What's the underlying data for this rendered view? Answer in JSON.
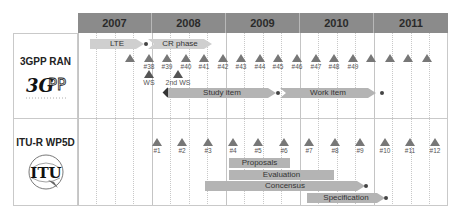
{
  "years": [
    "2007",
    "2008",
    "2009",
    "2010",
    "2011"
  ],
  "rows": [
    {
      "title": "3GPP RAN",
      "logo": "3GPP-logo",
      "logo_text": "3GPP",
      "phases": [
        {
          "label": "LTE"
        },
        {
          "label": "CR phase"
        },
        {
          "label": "Study item"
        },
        {
          "label": "Work item"
        }
      ],
      "meetings": [
        "",
        "#38",
        "#39",
        "#40",
        "#41",
        "#42",
        "#43",
        "#44",
        "#45",
        "#46",
        "#47",
        "#48",
        "#49",
        "",
        "",
        "",
        ""
      ],
      "workshops": [
        {
          "label": "WS"
        },
        {
          "label": "2nd WS"
        }
      ]
    },
    {
      "title": "ITU-R WP5D",
      "logo": "ITU-logo",
      "logo_text": "ITU",
      "meetings": [
        "#1",
        "#2",
        "#3",
        "#4",
        "#5",
        "#6",
        "#7",
        "#8",
        "#9",
        "#10",
        "#11",
        "#12"
      ],
      "activities": [
        {
          "label": "Proposals"
        },
        {
          "label": "Evaluation"
        },
        {
          "label": "Concensus"
        },
        {
          "label": "Specification"
        }
      ]
    }
  ],
  "colors": {
    "header": "#8b8b8b",
    "bar": "#b4b4b4",
    "marker": "#777777"
  }
}
